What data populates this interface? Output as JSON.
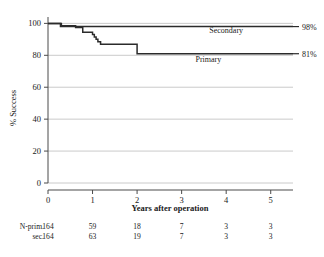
{
  "chart_data": {
    "type": "line",
    "title": "",
    "subtitle": "",
    "xlabel": "Years after operation",
    "ylabel": "% Success",
    "xlim": [
      0,
      5.5
    ],
    "ylim": [
      0,
      104
    ],
    "xticks": [
      0,
      1,
      2,
      3,
      4,
      5
    ],
    "xtick_labels": [
      "0",
      "1",
      "2",
      "3",
      "4",
      "5"
    ],
    "yticks": [
      0,
      20,
      40,
      60,
      80,
      100
    ],
    "ytick_labels": [
      "0",
      "20",
      "40",
      "60",
      "80",
      "100"
    ],
    "grid": "horizontal",
    "legend_position": "inline-right",
    "curve_style": "step",
    "series": [
      {
        "name": "Secondary",
        "label": "Secondary",
        "end_label": "98%",
        "end_value": 98,
        "color": "#2b2b2b",
        "points": [
          [
            0.0,
            100
          ],
          [
            0.28,
            100
          ],
          [
            0.28,
            98
          ],
          [
            5.5,
            98
          ]
        ]
      },
      {
        "name": "Primary",
        "label": "Primary",
        "end_label": "81%",
        "end_value": 81,
        "color": "#2b2b2b",
        "points": [
          [
            0.0,
            100
          ],
          [
            0.3,
            100
          ],
          [
            0.3,
            98.5
          ],
          [
            0.62,
            98.5
          ],
          [
            0.62,
            97.5
          ],
          [
            0.78,
            97.5
          ],
          [
            0.78,
            94.5
          ],
          [
            1.0,
            94.5
          ],
          [
            1.0,
            93.0
          ],
          [
            1.04,
            93.0
          ],
          [
            1.04,
            91.5
          ],
          [
            1.08,
            91.5
          ],
          [
            1.08,
            90.0
          ],
          [
            1.12,
            90.0
          ],
          [
            1.12,
            88.5
          ],
          [
            1.18,
            88.5
          ],
          [
            1.18,
            87.0
          ],
          [
            2.0,
            87.0
          ],
          [
            2.0,
            81.0
          ],
          [
            5.5,
            81.0
          ]
        ]
      }
    ],
    "annotations": [
      {
        "text": "Secondary",
        "x": 4.0,
        "y": 94
      },
      {
        "text": "Primary",
        "x": 3.6,
        "y": 76
      }
    ]
  },
  "risk_table": {
    "row_labels": [
      "N-prim.",
      "sec."
    ],
    "columns": [
      "0",
      "1",
      "2",
      "3",
      "4",
      "5"
    ],
    "rows": [
      {
        "label": "N-prim.",
        "values": [
          "164",
          "59",
          "18",
          "7",
          "3",
          "3"
        ]
      },
      {
        "label": "sec.",
        "values": [
          "164",
          "63",
          "19",
          "7",
          "3",
          "3"
        ]
      }
    ]
  },
  "colors": {
    "axis": "#4a4a4a",
    "grid": "#bdbdbd",
    "curve": "#2b2b2b",
    "text": "#1a1a1a",
    "background": "#ffffff"
  }
}
